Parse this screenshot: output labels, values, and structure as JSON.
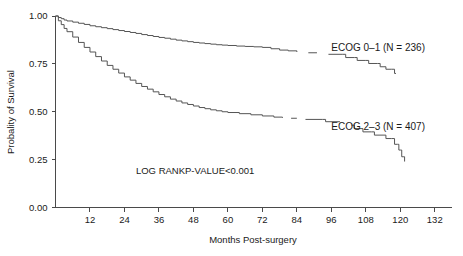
{
  "chart_data": {
    "type": "line",
    "title": "",
    "subtitle": "",
    "xlabel": "Months Post-surgery",
    "ylabel": "Probality of Survival",
    "xlim": [
      0,
      138
    ],
    "ylim": [
      0,
      1.0
    ],
    "grid": false,
    "legend_position": "inline-right",
    "xticks": [
      12,
      24,
      36,
      48,
      60,
      72,
      84,
      96,
      108,
      120,
      132
    ],
    "xtick_labels": [
      "12",
      "24",
      "36",
      "48",
      "60",
      "72",
      "84",
      "96",
      "108",
      "120",
      "132"
    ],
    "yticks": [
      0.0,
      0.25,
      0.5,
      0.75,
      1.0
    ],
    "ytick_labels": [
      "0.00",
      "0.25",
      "0.50",
      "0.75",
      "1.00"
    ],
    "annotations": [
      {
        "name": "log-rank-annotation",
        "text": "LOG RANKP-VALUE<0.001",
        "x": 28,
        "y": 0.175
      }
    ],
    "series": [
      {
        "name": "ECOG 0-1",
        "label": "ECOG 0–1 (N = 236)",
        "n": 236,
        "color": "#555555",
        "label_x": 96,
        "label_y": 0.815,
        "points": [
          [
            0,
            1.0
          ],
          [
            1,
            0.992
          ],
          [
            2,
            0.986
          ],
          [
            3,
            0.979
          ],
          [
            4,
            0.974
          ],
          [
            6,
            0.968
          ],
          [
            8,
            0.962
          ],
          [
            10,
            0.956
          ],
          [
            12,
            0.949
          ],
          [
            14,
            0.944
          ],
          [
            16,
            0.939
          ],
          [
            18,
            0.934
          ],
          [
            20,
            0.929
          ],
          [
            22,
            0.924
          ],
          [
            24,
            0.919
          ],
          [
            26,
            0.914
          ],
          [
            28,
            0.909
          ],
          [
            30,
            0.903
          ],
          [
            32,
            0.898
          ],
          [
            34,
            0.893
          ],
          [
            36,
            0.888
          ],
          [
            38,
            0.884
          ],
          [
            40,
            0.879
          ],
          [
            42,
            0.874
          ],
          [
            44,
            0.87
          ],
          [
            46,
            0.866
          ],
          [
            48,
            0.862
          ],
          [
            50,
            0.859
          ],
          [
            52,
            0.856
          ],
          [
            54,
            0.853
          ],
          [
            56,
            0.85
          ],
          [
            58,
            0.848
          ],
          [
            60,
            0.846
          ],
          [
            63,
            0.843
          ],
          [
            66,
            0.841
          ],
          [
            69,
            0.839
          ],
          [
            72,
            0.836
          ],
          [
            75,
            0.829
          ],
          [
            78,
            0.822
          ],
          [
            81,
            0.818
          ],
          [
            84,
            0.812
          ],
          [
            92,
            0.805
          ],
          [
            96,
            0.8
          ],
          [
            100,
            0.795
          ],
          [
            104,
            0.785
          ],
          [
            106,
            0.768
          ],
          [
            108,
            0.762
          ],
          [
            110,
            0.755
          ],
          [
            112,
            0.745
          ],
          [
            114,
            0.722
          ],
          [
            118,
            0.722
          ],
          [
            120,
            0.7
          ]
        ],
        "segments": [
          [
            [
              0,
              1.0
            ],
            [
              1,
              0.992
            ],
            [
              2,
              0.986
            ],
            [
              3,
              0.979
            ],
            [
              4,
              0.974
            ],
            [
              6,
              0.968
            ],
            [
              8,
              0.962
            ],
            [
              10,
              0.956
            ],
            [
              12,
              0.949
            ],
            [
              14,
              0.944
            ],
            [
              16,
              0.939
            ],
            [
              18,
              0.934
            ],
            [
              20,
              0.929
            ],
            [
              22,
              0.924
            ],
            [
              24,
              0.919
            ],
            [
              26,
              0.914
            ],
            [
              28,
              0.909
            ],
            [
              30,
              0.903
            ],
            [
              32,
              0.898
            ],
            [
              34,
              0.893
            ],
            [
              36,
              0.888
            ],
            [
              38,
              0.884
            ],
            [
              40,
              0.879
            ],
            [
              42,
              0.874
            ],
            [
              44,
              0.87
            ],
            [
              46,
              0.866
            ],
            [
              48,
              0.862
            ],
            [
              50,
              0.859
            ],
            [
              52,
              0.856
            ],
            [
              54,
              0.853
            ],
            [
              56,
              0.85
            ],
            [
              58,
              0.848
            ],
            [
              60,
              0.846
            ],
            [
              63,
              0.843
            ],
            [
              66,
              0.841
            ],
            [
              69,
              0.839
            ],
            [
              72,
              0.836
            ],
            [
              75,
              0.829
            ],
            [
              78,
              0.822
            ],
            [
              81,
              0.818
            ],
            [
              84,
              0.812
            ]
          ],
          [
            [
              88,
              0.808
            ],
            [
              91,
              0.808
            ]
          ],
          [
            [
              95,
              0.8
            ],
            [
              100,
              0.8
            ],
            [
              101,
              0.783
            ],
            [
              104,
              0.783
            ],
            [
              105,
              0.768
            ],
            [
              108,
              0.768
            ],
            [
              109,
              0.752
            ],
            [
              112,
              0.752
            ],
            [
              113,
              0.735
            ],
            [
              114,
              0.735
            ],
            [
              115,
              0.722
            ],
            [
              117,
              0.722
            ],
            [
              118,
              0.7
            ],
            [
              118.5,
              0.7
            ]
          ]
        ]
      },
      {
        "name": "ECOG 2-3",
        "label": "ECOG 2–3 (N = 407)",
        "n": 407,
        "color": "#555555",
        "label_x": 96,
        "label_y": 0.405,
        "points": [
          [
            0,
            1.0
          ],
          [
            1,
            0.975
          ],
          [
            2,
            0.955
          ],
          [
            3,
            0.935
          ],
          [
            4,
            0.918
          ],
          [
            6,
            0.89
          ],
          [
            8,
            0.862
          ],
          [
            10,
            0.836
          ],
          [
            12,
            0.812
          ],
          [
            14,
            0.788
          ],
          [
            16,
            0.765
          ],
          [
            18,
            0.742
          ],
          [
            20,
            0.722
          ],
          [
            22,
            0.702
          ],
          [
            24,
            0.682
          ],
          [
            26,
            0.665
          ],
          [
            28,
            0.648
          ],
          [
            30,
            0.632
          ],
          [
            32,
            0.618
          ],
          [
            34,
            0.604
          ],
          [
            36,
            0.59
          ],
          [
            38,
            0.578
          ],
          [
            40,
            0.566
          ],
          [
            42,
            0.556
          ],
          [
            44,
            0.546
          ],
          [
            46,
            0.538
          ],
          [
            48,
            0.53
          ],
          [
            50,
            0.522
          ],
          [
            52,
            0.516
          ],
          [
            54,
            0.51
          ],
          [
            56,
            0.505
          ],
          [
            58,
            0.5
          ],
          [
            60,
            0.496
          ],
          [
            64,
            0.49
          ],
          [
            68,
            0.484
          ],
          [
            72,
            0.478
          ],
          [
            76,
            0.472
          ],
          [
            80,
            0.466
          ],
          [
            84,
            0.458
          ],
          [
            88,
            0.448
          ],
          [
            92,
            0.44
          ],
          [
            96,
            0.432
          ],
          [
            100,
            0.4
          ],
          [
            104,
            0.372
          ],
          [
            108,
            0.35
          ],
          [
            112,
            0.33
          ],
          [
            116,
            0.3
          ],
          [
            118,
            0.27
          ],
          [
            121,
            0.24
          ]
        ],
        "segments": [
          [
            [
              0,
              1.0
            ],
            [
              1,
              0.975
            ],
            [
              2,
              0.955
            ],
            [
              3,
              0.935
            ],
            [
              4,
              0.918
            ],
            [
              6,
              0.89
            ],
            [
              8,
              0.862
            ],
            [
              10,
              0.836
            ],
            [
              12,
              0.812
            ],
            [
              14,
              0.788
            ],
            [
              16,
              0.765
            ],
            [
              18,
              0.742
            ],
            [
              20,
              0.722
            ],
            [
              22,
              0.702
            ],
            [
              24,
              0.682
            ],
            [
              26,
              0.665
            ],
            [
              28,
              0.648
            ],
            [
              30,
              0.632
            ],
            [
              32,
              0.618
            ],
            [
              34,
              0.604
            ],
            [
              36,
              0.59
            ],
            [
              38,
              0.578
            ],
            [
              40,
              0.566
            ],
            [
              42,
              0.556
            ],
            [
              44,
              0.546
            ],
            [
              46,
              0.538
            ],
            [
              48,
              0.53
            ],
            [
              50,
              0.522
            ],
            [
              52,
              0.516
            ],
            [
              54,
              0.51
            ],
            [
              56,
              0.505
            ],
            [
              58,
              0.5
            ],
            [
              60,
              0.496
            ],
            [
              64,
              0.49
            ],
            [
              68,
              0.484
            ],
            [
              72,
              0.478
            ],
            [
              76,
              0.472
            ],
            [
              79,
              0.468
            ]
          ],
          [
            [
              82,
              0.466
            ],
            [
              84,
              0.466
            ]
          ],
          [
            [
              87,
              0.46
            ],
            [
              93,
              0.46
            ],
            [
              94,
              0.448
            ],
            [
              99,
              0.448
            ]
          ],
          [
            [
              103,
              0.43
            ],
            [
              104,
              0.412
            ],
            [
              106,
              0.412
            ],
            [
              107,
              0.395
            ],
            [
              110,
              0.395
            ],
            [
              111,
              0.378
            ],
            [
              114,
              0.378
            ],
            [
              115,
              0.36
            ],
            [
              117,
              0.36
            ],
            [
              118,
              0.33
            ],
            [
              119,
              0.33
            ],
            [
              119.5,
              0.3
            ],
            [
              120,
              0.3
            ],
            [
              120.5,
              0.265
            ],
            [
              121,
              0.265
            ],
            [
              121.5,
              0.24
            ]
          ]
        ]
      }
    ]
  }
}
